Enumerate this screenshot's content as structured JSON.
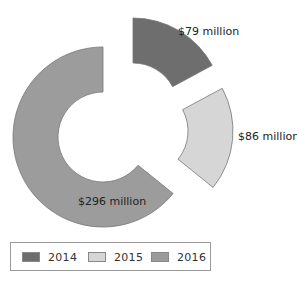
{
  "chart_data": {
    "type": "pie",
    "variant": "exploded-donut",
    "title": "",
    "categories": [
      "2014",
      "2015",
      "2016"
    ],
    "values": [
      79,
      86,
      296
    ],
    "unit": "million USD",
    "data_labels": [
      "$79 million",
      "$86 million",
      "$296 million"
    ],
    "colors": [
      "#6e6e6e",
      "#d6d6d6",
      "#9c9c9c"
    ],
    "legend": {
      "position": "bottom",
      "entries": [
        "2014",
        "2015",
        "2016"
      ]
    },
    "start_angle_deg": 0,
    "direction": "clockwise",
    "exploded": [
      "2014",
      "2015"
    ]
  },
  "legend": {
    "items": [
      {
        "label": "2014",
        "color": "#6e6e6e"
      },
      {
        "label": "2015",
        "color": "#d6d6d6"
      },
      {
        "label": "2016",
        "color": "#9c9c9c"
      }
    ]
  }
}
